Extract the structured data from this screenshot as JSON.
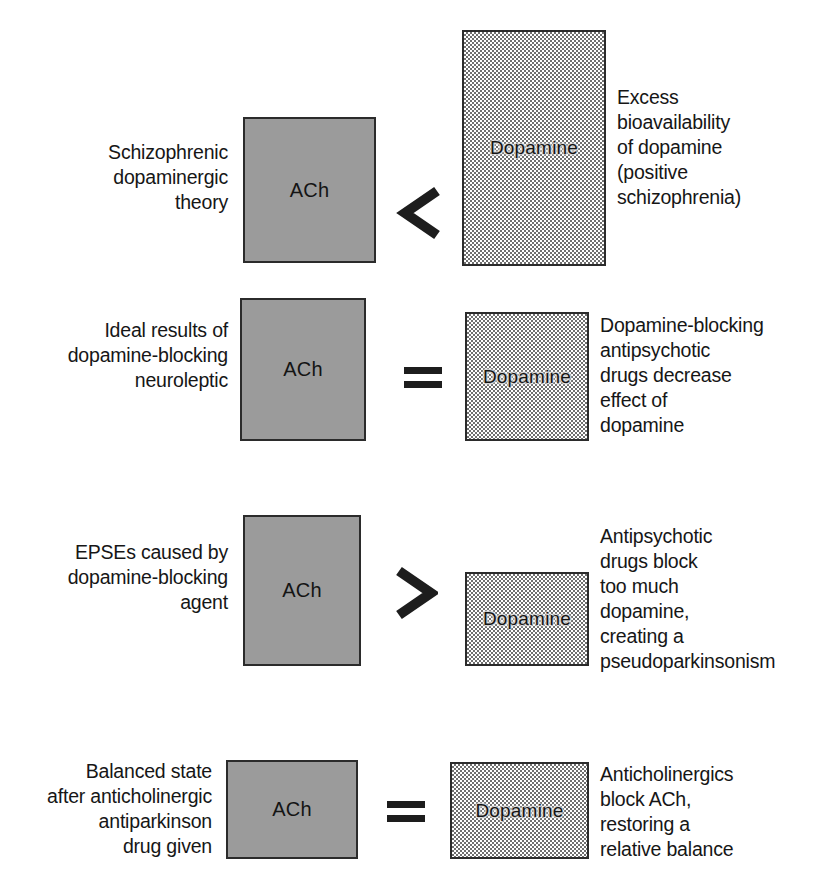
{
  "figure": {
    "type": "comparison-diagram",
    "background_color": "#ffffff",
    "ach_box_color": "#9b9b9b",
    "dopamine_box_fill": "dithered-gray-50",
    "border_color": "#2b2b2b",
    "text_color": "#161616"
  },
  "labels": {
    "ach": "ACh",
    "dopamine": "Dopamine"
  },
  "rows": [
    {
      "id": "schizophrenic-dopaminergic-theory",
      "left_caption": "Schizophrenic\ndopaminergic\ntheory",
      "left_box_label": "ACh",
      "operator": "<",
      "operator_name": "less-than",
      "right_box_label": "Dopamine",
      "right_caption": "Excess\nbioavailability\nof dopamine\n(positive\nschizophrenia)"
    },
    {
      "id": "ideal-results-neuroleptic",
      "left_caption": "Ideal results of\ndopamine-blocking\nneuroleptic",
      "left_box_label": "ACh",
      "operator": "=",
      "operator_name": "equals",
      "right_box_label": "Dopamine",
      "right_caption": "Dopamine-blocking\nantipsychotic\ndrugs decrease\neffect of\ndopamine"
    },
    {
      "id": "epses-caused-by-dopamine-blocking-agent",
      "left_caption": "EPSEs caused by\ndopamine-blocking\nagent",
      "left_box_label": "ACh",
      "operator": ">",
      "operator_name": "greater-than",
      "right_box_label": "Dopamine",
      "right_caption": "Antipsychotic\ndrugs block\ntoo much\ndopamine,\ncreating a\npseudoparkinsonism"
    },
    {
      "id": "balanced-state-after-anticholinergic",
      "left_caption": "Balanced state\nafter anticholinergic\nantiparkinson\ndrug given",
      "left_box_label": "ACh",
      "operator": "=",
      "operator_name": "equals",
      "right_box_label": "Dopamine",
      "right_caption": "Anticholinergics\nblock ACh,\nrestoring a\nrelative balance"
    }
  ]
}
